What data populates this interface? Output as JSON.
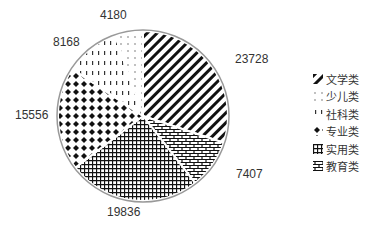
{
  "chart_data": {
    "type": "pie",
    "title": "",
    "categories": [
      "文学类",
      "教育类",
      "实用类",
      "专业类",
      "社科类",
      "少儿类"
    ],
    "values": [
      23728,
      7407,
      19836,
      15556,
      8168,
      4180
    ],
    "legend": [
      "文学类",
      "少儿类",
      "社科类",
      "专业类",
      "实用类",
      "教育类"
    ],
    "legend_position": "right",
    "start_angle": "12 o'clock, clockwise",
    "patterns": {
      "文学类": "diagonal-stripes",
      "教育类": "brick",
      "实用类": "grid",
      "专业类": "diamonds",
      "社科类": "vertical-dashes",
      "少儿类": "dots"
    }
  },
  "labels": {
    "wenxue": "23728",
    "jiaoyu": "7407",
    "shiyong": "19836",
    "zhuanye": "15556",
    "sheke": "8168",
    "shaoer": "4180"
  },
  "legend": {
    "items": [
      "文学类",
      "少儿类",
      "社科类",
      "专业类",
      "实用类",
      "教育类"
    ]
  }
}
